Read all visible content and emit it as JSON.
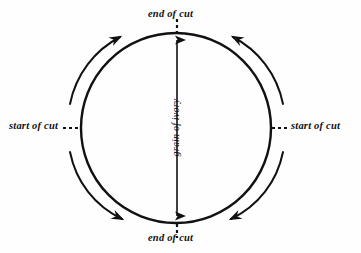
{
  "diagram": {
    "background_color": "#fefefe",
    "ink_color": "#111111",
    "labels": {
      "end_of_cut_top": "end of cut",
      "end_of_cut_bottom": "end of cut",
      "start_of_cut_left": "start of cut",
      "start_of_cut_right": "start of cut",
      "grain_of_ivory": "grain of ivory"
    },
    "circle": {
      "center_x": 176,
      "center_y": 128,
      "radius": 95,
      "stroke_width": 2.4
    },
    "grain_axis": {
      "x": 177,
      "top_y": 38,
      "bottom_y": 218,
      "double_headed": true
    },
    "leader_dashes": {
      "top": {
        "x": 177,
        "from_y": 19,
        "to_y": 32
      },
      "bottom": {
        "x": 177,
        "from_y": 224,
        "to_y": 237
      },
      "left": {
        "y": 128,
        "from_x": 62,
        "to_x": 80
      },
      "right": {
        "y": 128,
        "from_x": 272,
        "to_x": 290
      }
    },
    "rotation_arrows": [
      {
        "name": "arrow-top-left",
        "direction": "clockwise-up-right"
      },
      {
        "name": "arrow-top-right",
        "direction": "counterclockwise-up-left"
      },
      {
        "name": "arrow-bottom-left",
        "direction": "clockwise-down-right"
      },
      {
        "name": "arrow-bottom-right",
        "direction": "counterclockwise-down-left"
      }
    ]
  }
}
